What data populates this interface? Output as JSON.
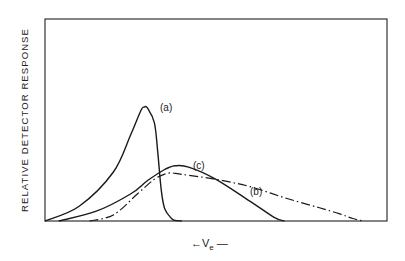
{
  "chart_data": {
    "type": "line",
    "title": "",
    "xlabel": "← Ve —",
    "xlabel_main": "V",
    "xlabel_sub": "e",
    "ylabel": "RELATIVE DETECTOR RESPONSE",
    "xlim": [
      0,
      100
    ],
    "ylim": [
      0,
      100
    ],
    "grid": false,
    "legend": "inline labels",
    "x_ticks": [],
    "y_ticks": [],
    "series": [
      {
        "name": "(a)",
        "style": "solid",
        "x": [
          0,
          10,
          20,
          25,
          28,
          29,
          30,
          32,
          33,
          34,
          35,
          37,
          38,
          40
        ],
        "y": [
          0,
          12,
          40,
          70,
          90,
          93,
          92,
          80,
          55,
          25,
          10,
          2,
          0.5,
          0
        ]
      },
      {
        "name": "(c)",
        "style": "solid",
        "x": [
          4,
          15,
          25,
          30,
          35,
          38,
          42,
          50,
          60,
          67,
          70
        ],
        "y": [
          0,
          8,
          22,
          33,
          42,
          45,
          44,
          34,
          16,
          3,
          0
        ]
      },
      {
        "name": "(b)",
        "style": "dash-dot",
        "x": [
          13,
          20,
          27,
          32,
          36,
          40,
          50,
          60,
          70,
          80,
          86,
          90,
          93
        ],
        "y": [
          0,
          5,
          22,
          34,
          39,
          38,
          34,
          28,
          19,
          11,
          6,
          2,
          0
        ]
      }
    ],
    "annotations": [
      {
        "text": "(a)",
        "x": 35,
        "y": 92
      },
      {
        "text": "(c)",
        "x": 45,
        "y": 44
      },
      {
        "text": "(b)",
        "x": 62,
        "y": 24
      }
    ]
  },
  "labels": {
    "ylabel": "RELATIVE DETECTOR RESPONSE",
    "a": "(a)",
    "b": "(b)",
    "c": "(c)",
    "x_arrow": "←",
    "x_main": "V",
    "x_sub": "e",
    "x_tail": "—"
  }
}
